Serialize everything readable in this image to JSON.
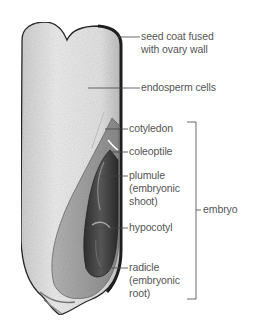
{
  "diagram": {
    "labels": [
      {
        "id": "seed-coat",
        "text": "seed coat fused\nwith ovary wall"
      },
      {
        "id": "endosperm",
        "text": "endosperm cells"
      },
      {
        "id": "cotyledon",
        "text": "cotyledon"
      },
      {
        "id": "coleoptile",
        "text": "coleoptile"
      },
      {
        "id": "plumule",
        "text": "plumule\n(embryonic\nshoot)"
      },
      {
        "id": "hypocotyl",
        "text": "hypocotyl"
      },
      {
        "id": "radicle",
        "text": "radicle\n(embryonic\nroot)"
      }
    ],
    "bracket_label": "embryo",
    "colors": {
      "label_text": "#555555",
      "leader_line": "#444444",
      "seed_coat": "#2a2a2a",
      "endosperm": "#e6e6e6",
      "embryo_tissue": "#9a9a9a",
      "embryo_dark": "#3c3c3c"
    }
  }
}
